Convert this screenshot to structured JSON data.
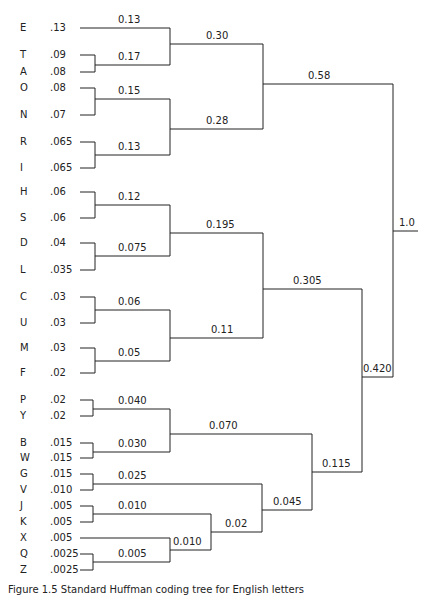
{
  "figure": {
    "caption": "Figure 1.5  Standard Huffman coding tree for English letters",
    "root_value": "1.0"
  },
  "leaves": [
    {
      "letter": "E",
      "prob": ".13",
      "y": 28
    },
    {
      "letter": "T",
      "prob": ".09",
      "y": 55
    },
    {
      "letter": "A",
      "prob": ".08",
      "y": 72
    },
    {
      "letter": "O",
      "prob": ".08",
      "y": 88
    },
    {
      "letter": "N",
      "prob": ".07",
      "y": 115
    },
    {
      "letter": "R",
      "prob": ".065",
      "y": 142
    },
    {
      "letter": "I",
      "prob": ".065",
      "y": 168
    },
    {
      "letter": "H",
      "prob": ".06",
      "y": 192
    },
    {
      "letter": "S",
      "prob": ".06",
      "y": 218
    },
    {
      "letter": "D",
      "prob": ".04",
      "y": 243
    },
    {
      "letter": "L",
      "prob": ".035",
      "y": 270
    },
    {
      "letter": "C",
      "prob": ".03",
      "y": 297
    },
    {
      "letter": "U",
      "prob": ".03",
      "y": 323
    },
    {
      "letter": "M",
      "prob": ".03",
      "y": 348
    },
    {
      "letter": "F",
      "prob": ".02",
      "y": 373
    },
    {
      "letter": "P",
      "prob": ".02",
      "y": 400
    },
    {
      "letter": "Y",
      "prob": ".02",
      "y": 416
    },
    {
      "letter": "B",
      "prob": ".015",
      "y": 443
    },
    {
      "letter": "W",
      "prob": ".015",
      "y": 458
    },
    {
      "letter": "G",
      "prob": ".015",
      "y": 474
    },
    {
      "letter": "V",
      "prob": ".010",
      "y": 490
    },
    {
      "letter": "J",
      "prob": ".005",
      "y": 506
    },
    {
      "letter": "K",
      "prob": ".005",
      "y": 522
    },
    {
      "letter": "X",
      "prob": ".005",
      "y": 538
    },
    {
      "letter": "Q",
      "prob": ".0025",
      "y": 554
    },
    {
      "letter": "Z",
      "prob": ".0025",
      "y": 570
    }
  ],
  "nodes": [
    {
      "id": "TA",
      "value": "0.17",
      "children": [
        "T",
        "A"
      ]
    },
    {
      "id": "E-TA",
      "value": "0.30",
      "children": [
        "E",
        "TA"
      ]
    },
    {
      "id": "ON",
      "value": "0.15",
      "children": [
        "O",
        "N"
      ]
    },
    {
      "id": "RI",
      "value": "0.13",
      "children": [
        "R",
        "I"
      ]
    },
    {
      "id": "ONRI",
      "value": "0.28",
      "children": [
        "ON",
        "RI"
      ]
    },
    {
      "id": "top",
      "value": "0.58",
      "children": [
        "E-TA",
        "ONRI"
      ]
    },
    {
      "id": "HS",
      "value": "0.12",
      "children": [
        "H",
        "S"
      ]
    },
    {
      "id": "DL",
      "value": "0.075",
      "children": [
        "D",
        "L"
      ]
    },
    {
      "id": "HSDL",
      "value": "0.195",
      "children": [
        "HS",
        "DL"
      ]
    },
    {
      "id": "CU",
      "value": "0.06",
      "children": [
        "C",
        "U"
      ]
    },
    {
      "id": "MF",
      "value": "0.05",
      "children": [
        "M",
        "F"
      ]
    },
    {
      "id": "CUMF",
      "value": "0.11",
      "children": [
        "CU",
        "MF"
      ]
    },
    {
      "id": "mid",
      "value": "0.305",
      "children": [
        "HSDL",
        "CUMF"
      ]
    },
    {
      "id": "PY",
      "value": "0.040",
      "children": [
        "P",
        "Y"
      ]
    },
    {
      "id": "BW",
      "value": "0.030",
      "children": [
        "B",
        "W"
      ]
    },
    {
      "id": "PYBW",
      "value": "0.070",
      "children": [
        "PY",
        "BW"
      ]
    },
    {
      "id": "GV",
      "value": "0.025",
      "children": [
        "G",
        "V"
      ]
    },
    {
      "id": "JK",
      "value": "0.010",
      "children": [
        "J",
        "K"
      ]
    },
    {
      "id": "QZ",
      "value": "0.005",
      "children": [
        "Q",
        "Z"
      ]
    },
    {
      "id": "XQZ",
      "value": "0.010",
      "children": [
        "X",
        "QZ"
      ]
    },
    {
      "id": "JKXQZ",
      "value": "0.02",
      "children": [
        "JK",
        "XQZ"
      ]
    },
    {
      "id": "GVJK",
      "value": "0.045",
      "children": [
        "GV",
        "JKXQZ"
      ]
    },
    {
      "id": "low",
      "value": "0.115",
      "children": [
        "PYBW",
        "GVJK"
      ]
    },
    {
      "id": "bottom",
      "value": "0.420",
      "children": [
        "mid",
        "low"
      ]
    },
    {
      "id": "root",
      "value": "1.0",
      "children": [
        "top",
        "bottom"
      ]
    }
  ],
  "labels": {
    "n013_E": "0.13",
    "n017": "0.17",
    "n030": "0.30",
    "n015": "0.15",
    "n013_RI": "0.13",
    "n028": "0.28",
    "n058": "0.58",
    "n012": "0.12",
    "n0075": "0.075",
    "n0195": "0.195",
    "n006": "0.06",
    "n005": "0.05",
    "n011": "0.11",
    "n0305": "0.305",
    "n0040": "0.040",
    "n0030": "0.030",
    "n0070": "0.070",
    "n0025": "0.025",
    "n0010_JK": "0.010",
    "n0005": "0.005",
    "n0010_X": "0.010",
    "n002": "0.02",
    "n0045": "0.045",
    "n0115": "0.115",
    "n0420": "0.420",
    "n10": "1.0"
  },
  "colors": {
    "line": "#222222",
    "background": "#ffffff"
  }
}
